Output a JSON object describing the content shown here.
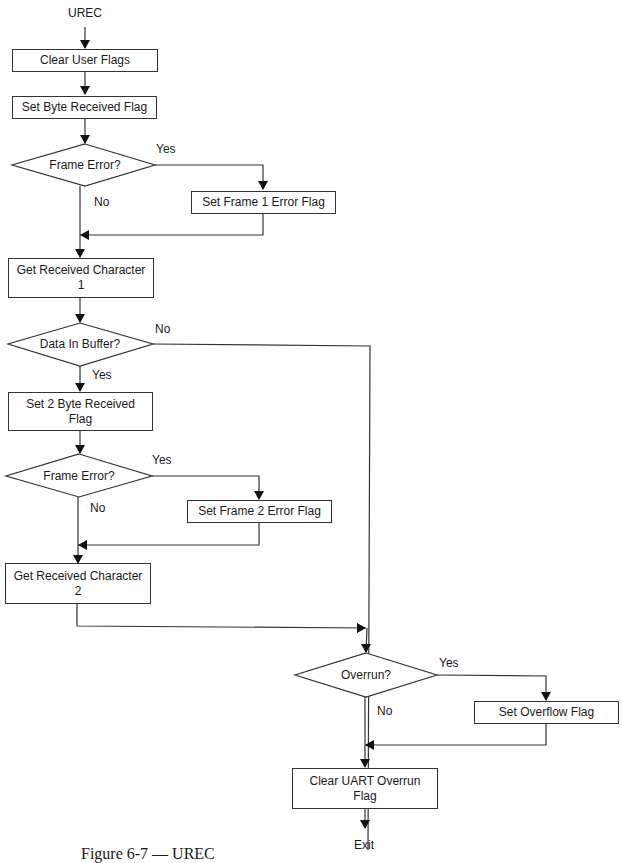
{
  "title": "UREC",
  "nodes": {
    "start": "UREC",
    "clear_user_flags": "Clear User Flags",
    "set_byte_received": "Set Byte Received Flag",
    "frame_error_1": "Frame Error?",
    "set_frame1_error": "Set Frame 1 Error Flag",
    "get_char_1": "Get Received Character 1",
    "data_in_buffer": "Data In Buffer?",
    "set_2byte_received": "Set 2 Byte Received Flag",
    "frame_error_2": "Frame Error?",
    "set_frame2_error": "Set Frame 2 Error Flag",
    "get_char_2": "Get Received Character 2",
    "overrun": "Overrun?",
    "set_overflow": "Set Overflow Flag",
    "clear_uart_overrun": "Clear UART Overrun Flag",
    "exit": "Exit"
  },
  "edge_labels": {
    "fe1_yes": "Yes",
    "fe1_no": "No",
    "dib_no": "No",
    "dib_yes": "Yes",
    "fe2_yes": "Yes",
    "fe2_no": "No",
    "ovr_yes": "Yes",
    "ovr_no": "No"
  },
  "caption": "Figure 6-7 — UREC"
}
